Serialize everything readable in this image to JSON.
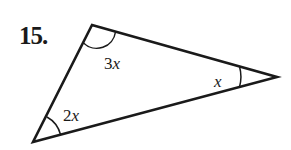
{
  "problem": {
    "number": "15."
  },
  "triangle": {
    "vertices": {
      "top": [
        92,
        25
      ],
      "right": [
        277,
        77
      ],
      "bottom_left": [
        33,
        142
      ]
    },
    "angles": {
      "top": {
        "coef": "3",
        "var": "x"
      },
      "right": {
        "coef": "",
        "var": "x"
      },
      "bottom_left": {
        "coef": "2",
        "var": "x"
      }
    },
    "stroke_color": "#1a1a1a"
  }
}
